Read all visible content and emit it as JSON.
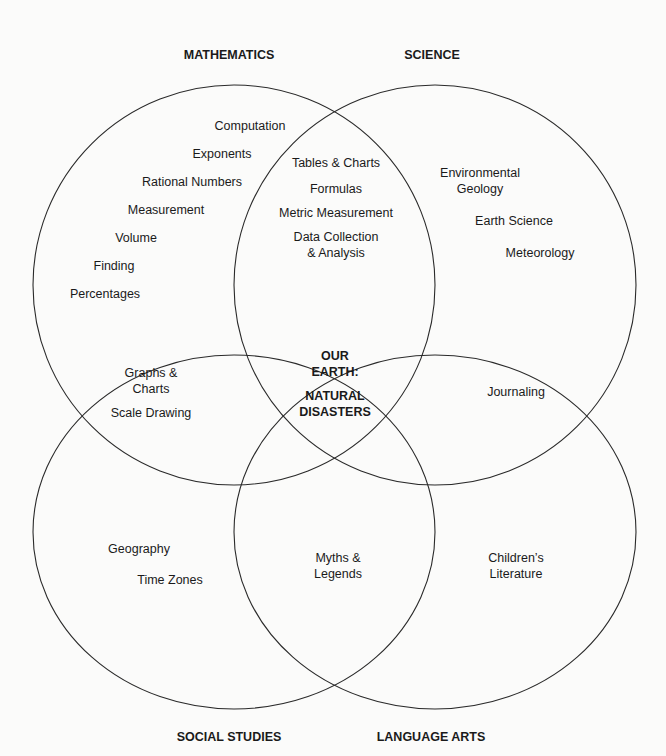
{
  "diagram": {
    "type": "four-set venn",
    "center": {
      "line1": "OUR",
      "line2": "EARTH:",
      "line3": "NATURAL",
      "line4": "DISASTERS"
    },
    "sets": {
      "mathematics": {
        "title": "MATHEMATICS"
      },
      "science": {
        "title": "SCIENCE"
      },
      "social_studies": {
        "title": "SOCIAL STUDIES"
      },
      "language_arts": {
        "title": "LANGUAGE ARTS"
      }
    },
    "regions": {
      "math_only": [
        "Computation",
        "Exponents",
        "Rational Numbers",
        "Measurement",
        "Volume",
        "Finding",
        "Percentages"
      ],
      "math_science": [
        "Tables & Charts",
        "Formulas",
        "Metric Measurement",
        "Data Collection",
        "& Analysis"
      ],
      "science_only": [
        "Environmental",
        "Geology",
        "Earth Science",
        "Meteorology"
      ],
      "math_social": [
        "Graphs &",
        "Charts",
        "Scale Drawing"
      ],
      "science_language": [
        "Journaling"
      ],
      "social_only": [
        "Geography",
        "Time Zones"
      ],
      "social_language": [
        "Myths &",
        "Legends"
      ],
      "language_only": [
        "Children’s",
        "Literature"
      ]
    }
  }
}
